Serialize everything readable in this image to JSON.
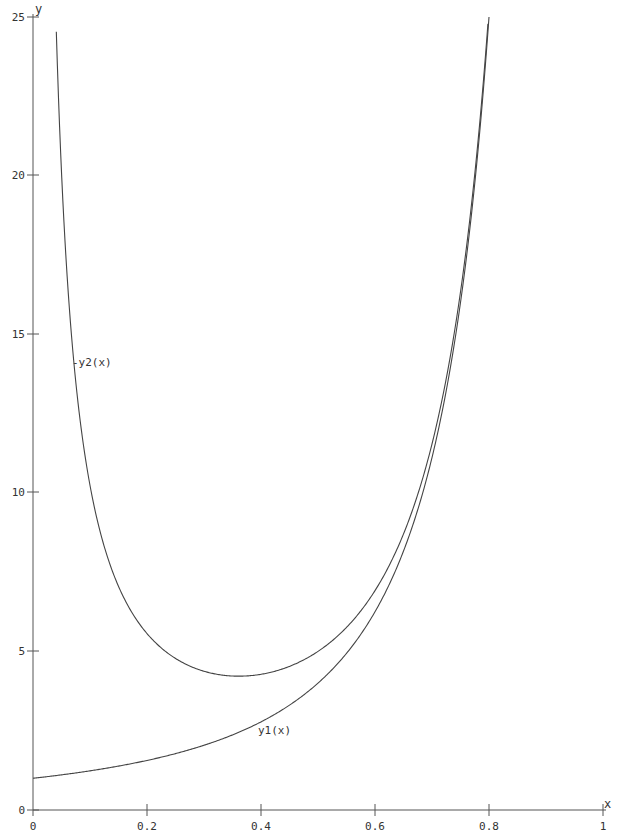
{
  "chart_data": {
    "type": "line",
    "title": "",
    "xlabel": "x",
    "ylabel": "y",
    "xlim": [
      0,
      1
    ],
    "ylim": [
      0,
      25
    ],
    "grid": false,
    "legend": "none (inline curve labels)",
    "x_ticks": [
      "0",
      "0.2",
      "0.4",
      "0.6",
      "0.8",
      "1"
    ],
    "y_ticks": [
      "0",
      "5",
      "10",
      "15",
      "20",
      "25"
    ],
    "series": [
      {
        "name": "y1(x)",
        "label_position": {
          "x": 0.41,
          "y": 2.4
        },
        "x": [
          0.0,
          0.1,
          0.2,
          0.3,
          0.4,
          0.5,
          0.6,
          0.7,
          0.75,
          0.8
        ],
        "values": [
          1.0,
          1.23,
          1.56,
          2.04,
          2.78,
          4.0,
          6.25,
          11.1,
          16.0,
          25.0
        ]
      },
      {
        "name": "-y2(x)",
        "label_position": {
          "x": 0.07,
          "y": 14.0
        },
        "x": [
          0.04,
          0.05,
          0.1,
          0.15,
          0.2,
          0.3,
          0.35,
          0.4,
          0.5,
          0.6,
          0.7,
          0.75,
          0.8
        ],
        "values": [
          25.1,
          20.1,
          10.2,
          7.05,
          5.56,
          4.37,
          4.22,
          4.28,
          5.0,
          6.92,
          11.5,
          16.3,
          25.25
        ]
      }
    ]
  },
  "labels": {
    "x_axis": "x",
    "y_axis": "y",
    "y1": "y1(x)",
    "y2": "-y2(x)",
    "x_ticks": [
      "0",
      "0.2",
      "0.4",
      "0.6",
      "0.8",
      "1"
    ],
    "y_ticks": [
      "0",
      "5",
      "10",
      "15",
      "20",
      "25"
    ]
  }
}
